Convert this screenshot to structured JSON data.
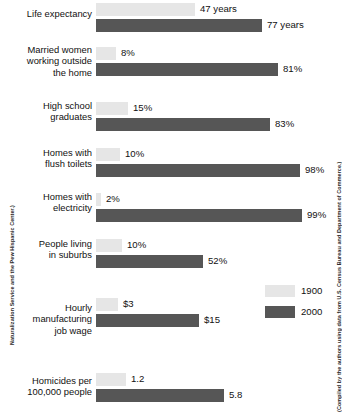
{
  "chart_data": {
    "type": "bar",
    "orientation": "horizontal",
    "title": "",
    "xlabel": "",
    "ylabel": "",
    "grid": false,
    "legend_position": "middle-right",
    "series": [
      {
        "name": "1900",
        "color": "#e6e6e6"
      },
      {
        "name": "2000",
        "color": "#565656"
      }
    ],
    "categories": [
      "Life expectancy",
      "Married women working outside the home",
      "High school graduates",
      "Homes with flush toilets",
      "Homes with electricity",
      "People living in suburbs",
      "Hourly manufacturing job wage",
      "Homicides per 100,000 people"
    ],
    "rows": [
      {
        "label_lines": [
          "Life expectancy"
        ],
        "values": [
          {
            "series": "1900",
            "value": 47,
            "display": "47 years",
            "bar_px": 99
          },
          {
            "series": "2000",
            "value": 77,
            "display": "77 years",
            "bar_px": 166
          }
        ]
      },
      {
        "label_lines": [
          "Married women",
          "working outside",
          "the home"
        ],
        "values": [
          {
            "series": "1900",
            "value": 8,
            "display": "8%",
            "bar_px": 20
          },
          {
            "series": "2000",
            "value": 81,
            "display": "81%",
            "bar_px": 182
          }
        ]
      },
      {
        "label_lines": [
          "High school",
          "graduates"
        ],
        "values": [
          {
            "series": "1900",
            "value": 15,
            "display": "15%",
            "bar_px": 32
          },
          {
            "series": "2000",
            "value": 83,
            "display": "83%",
            "bar_px": 174
          }
        ]
      },
      {
        "label_lines": [
          "Homes with",
          "flush toilets"
        ],
        "values": [
          {
            "series": "1900",
            "value": 10,
            "display": "10%",
            "bar_px": 24
          },
          {
            "series": "2000",
            "value": 98,
            "display": "98%",
            "bar_px": 204
          }
        ]
      },
      {
        "label_lines": [
          "Homes with",
          "electricity"
        ],
        "values": [
          {
            "series": "1900",
            "value": 2,
            "display": "2%",
            "bar_px": 5
          },
          {
            "series": "2000",
            "value": 99,
            "display": "99%",
            "bar_px": 206
          }
        ]
      },
      {
        "label_lines": [
          "People living",
          "in suburbs"
        ],
        "values": [
          {
            "series": "1900",
            "value": 10,
            "display": "10%",
            "bar_px": 26
          },
          {
            "series": "2000",
            "value": 52,
            "display": "52%",
            "bar_px": 107
          }
        ]
      },
      {
        "label_lines": [
          "Hourly",
          "manufacturing",
          "job wage"
        ],
        "values": [
          {
            "series": "1900",
            "value": 3,
            "display": "$3",
            "bar_px": 22
          },
          {
            "series": "2000",
            "value": 15,
            "display": "$15",
            "bar_px": 103
          }
        ]
      },
      {
        "label_lines": [
          "Homicides per",
          "100,000 people"
        ],
        "values": [
          {
            "series": "1900",
            "value": 1.2,
            "display": "1.2",
            "bar_px": 30
          },
          {
            "series": "2000",
            "value": 5.8,
            "display": "5.8",
            "bar_px": 128
          }
        ]
      }
    ]
  },
  "legend": {
    "items": [
      {
        "label": "1900",
        "color": "#e6e6e6"
      },
      {
        "label": "2000",
        "color": "#565656"
      }
    ]
  },
  "credits": {
    "left": "Naturalization Service and the Pew Hispanic Center.)",
    "right": "(Compiled by the authors using data from U.S. Census Bureau and Department of Commerce.)"
  }
}
